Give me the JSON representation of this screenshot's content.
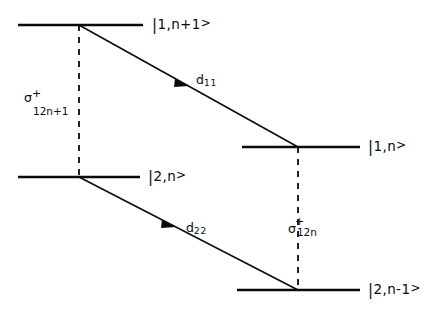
{
  "figure": {
    "type": "energy-level-diagram",
    "background_color": "#ffffff",
    "ink_color": "#0a0a0a",
    "levels": [
      {
        "id": "level-1-n-plus-1",
        "label": "|1,n+1>",
        "bar": "|",
        "body": "1,n+1",
        "gt": ">",
        "x1": 18,
        "x2": 143,
        "y": 25,
        "label_x": 152,
        "label_y": 17
      },
      {
        "id": "level-2-n",
        "label": "|2,n>",
        "bar": "|",
        "body": "2,n",
        "gt": ">",
        "x1": 18,
        "x2": 140,
        "y": 177,
        "label_x": 148,
        "label_y": 169
      },
      {
        "id": "level-1-n",
        "label": "|1,n>",
        "bar": "|",
        "body": "1,n",
        "gt": ">",
        "x1": 242,
        "x2": 360,
        "y": 147,
        "label_x": 368,
        "label_y": 139
      },
      {
        "id": "level-2-n-minus-1",
        "label": "|2,n-1>",
        "bar": "|",
        "body": "2,n-1",
        "gt": ">",
        "x1": 237,
        "x2": 360,
        "y": 290,
        "label_x": 368,
        "label_y": 282
      }
    ],
    "transitions": [
      {
        "id": "transition-d11",
        "label": "d",
        "sub": "11",
        "from": {
          "x": 79,
          "y": 25
        },
        "to": {
          "x": 298,
          "y": 147
        },
        "arrow_at": {
          "x": 183,
          "y": 83
        },
        "label_x": 196,
        "label_y": 74
      },
      {
        "id": "transition-d22",
        "label": "d",
        "sub": "22",
        "from": {
          "x": 79,
          "y": 177
        },
        "to": {
          "x": 298,
          "y": 290
        },
        "arrow_at": {
          "x": 170,
          "y": 224
        },
        "label_x": 186,
        "label_y": 222
      }
    ],
    "couplings": [
      {
        "id": "coupling-sigma-12n-plus-1",
        "symbol": "σ",
        "superscript": "+",
        "subscript": "12n+1",
        "x": 79,
        "y1": 25,
        "y2": 177,
        "label_x": 24,
        "label_y": 90
      },
      {
        "id": "coupling-sigma-12n",
        "symbol": "σ",
        "superscript": "+",
        "subscript": "12n",
        "x": 298,
        "y1": 147,
        "y2": 290,
        "label_x": 288,
        "label_y": 223
      }
    ]
  }
}
